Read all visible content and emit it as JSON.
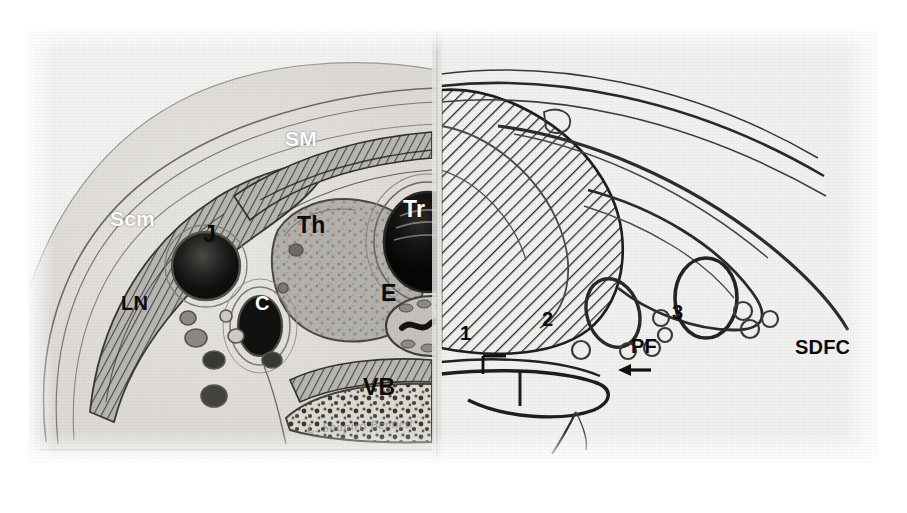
{
  "figure": {
    "kind": "anatomical-cross-section",
    "background_color": "#ffffff",
    "plate_color": "#f2f2f0",
    "ink_color": "#1a1a1a"
  },
  "labels_left": [
    {
      "id": "sm",
      "text": "SM",
      "meaning": "strap muscles",
      "color": "white",
      "size": "sm",
      "x": 285,
      "y": 128
    },
    {
      "id": "scm",
      "text": "Scm",
      "meaning": "sternocleidomastoid muscle",
      "color": "white",
      "size": "sm",
      "x": 110,
      "y": 208
    },
    {
      "id": "th",
      "text": "Th",
      "meaning": "thyroid gland",
      "color": "black",
      "size": "lg",
      "x": 297,
      "y": 214
    },
    {
      "id": "tr",
      "text": "Tr",
      "meaning": "trachea",
      "color": "white",
      "size": "lg",
      "x": 403,
      "y": 198
    },
    {
      "id": "j",
      "text": "J",
      "meaning": "internal jugular vein",
      "color": "black",
      "size": "lg",
      "x": 203,
      "y": 223
    },
    {
      "id": "ln",
      "text": "LN",
      "meaning": "lymph nodes",
      "color": "black",
      "size": "md",
      "x": 121,
      "y": 293
    },
    {
      "id": "c",
      "text": "C",
      "meaning": "common carotid artery",
      "color": "white",
      "size": "md",
      "x": 255,
      "y": 293
    },
    {
      "id": "e",
      "text": "E",
      "meaning": "esophagus",
      "color": "black",
      "size": "lg",
      "x": 381,
      "y": 282
    },
    {
      "id": "vb",
      "text": "VB",
      "meaning": "vertebral body",
      "color": "black",
      "size": "lg",
      "x": 363,
      "y": 376
    }
  ],
  "labels_right": [
    {
      "id": "n1",
      "text": "1",
      "meaning": "fascial plane 1",
      "color": "black",
      "size": "md",
      "x": 460,
      "y": 323
    },
    {
      "id": "n2",
      "text": "2",
      "meaning": "fascial plane 2",
      "color": "black",
      "size": "md",
      "x": 542,
      "y": 309
    },
    {
      "id": "n3",
      "text": "3",
      "meaning": "fascial plane 3",
      "color": "black",
      "size": "md",
      "x": 672,
      "y": 302
    },
    {
      "id": "pf",
      "text": "PF",
      "meaning": "prevertebral fascia",
      "color": "black",
      "size": "md",
      "x": 631,
      "y": 336
    },
    {
      "id": "sdfc",
      "text": "SDFC",
      "meaning": "superficial deep fascia of the cervix",
      "color": "black",
      "size": "md",
      "x": 795,
      "y": 337
    }
  ],
  "annotations": {
    "arrow": {
      "name": "pf-arrow",
      "points_to": "PF",
      "x": 601,
      "y": 339,
      "direction": "left"
    },
    "bracket": {
      "name": "level-1-bracket",
      "x": 455,
      "y": 330
    }
  },
  "signature": {
    "text": "L. Shapiro Bennett",
    "x": 307,
    "y": 418
  },
  "divider": {
    "name": "half-split-line",
    "x": 437,
    "description": "vertical seam separating photographic half from schematic half"
  }
}
